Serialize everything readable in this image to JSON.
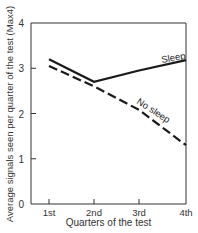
{
  "chart_data": {
    "type": "line",
    "title": "",
    "xlabel": "Quarters of the test",
    "ylabel": "Average signals seen per quarter of the test (Max4)",
    "categories": [
      "1st",
      "2nd",
      "3rd",
      "4th"
    ],
    "ylim": [
      0,
      4
    ],
    "yticks": [
      0,
      1,
      2,
      3,
      4
    ],
    "grid": false,
    "legend": "inline labels",
    "series": [
      {
        "name": "Sleep",
        "style": "solid",
        "values": [
          3.2,
          2.7,
          2.95,
          3.18
        ]
      },
      {
        "name": "No sleep",
        "style": "dashed",
        "values": [
          3.05,
          2.6,
          2.08,
          1.3
        ]
      }
    ],
    "annotations": [
      "Sleep",
      "No sleep"
    ]
  },
  "colors": {
    "line": "#1a1a1a",
    "axis": "#333333",
    "text": "#333333"
  }
}
